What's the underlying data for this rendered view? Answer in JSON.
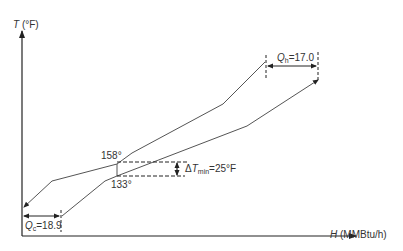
{
  "diagram": {
    "type": "composite-curve",
    "y_axis": {
      "symbol": "T",
      "unit": "(°F)"
    },
    "x_axis": {
      "symbol": "H",
      "unit": "(MMBtu/h)"
    },
    "hot_target": {
      "symbol": "Q",
      "sub": "h",
      "value": "=17.0"
    },
    "cold_target": {
      "symbol": "Q",
      "sub": "c",
      "value": "=18.9"
    },
    "pinch": {
      "hot_temp": "158°",
      "cold_temp": "133°",
      "delta_prefix": "Δ",
      "delta_symbol": "T",
      "delta_sub": "min",
      "delta_value": "=25°F"
    },
    "colors": {
      "curve": "#555555",
      "axis": "#222222",
      "dash": "#222222"
    }
  }
}
